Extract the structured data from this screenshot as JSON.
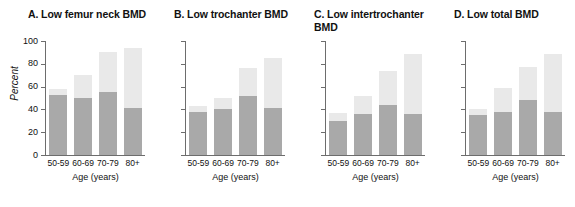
{
  "figure": {
    "axis_title_x": "Age (years)",
    "axis_title_y": "Percent",
    "categories": [
      "50-59",
      "60-69",
      "70-79",
      "80+"
    ],
    "yticks": [
      "0",
      "20",
      "40",
      "60",
      "80",
      "100"
    ],
    "colors": {
      "dark_series": "#a9a9a9",
      "light_series": "#e9e9e9",
      "axis": "#6d6d6d",
      "text": "#111111",
      "background": "#ffffff"
    }
  },
  "panels": [
    {
      "title": "A. Low femur neck BMD",
      "show_y_labels": true
    },
    {
      "title": "B. Low trochanter BMD",
      "show_y_labels": false
    },
    {
      "title": "C. Low intertrochanter\n    BMD",
      "show_y_labels": false
    },
    {
      "title": "D. Low total BMD",
      "show_y_labels": false
    }
  ],
  "chart_data": [
    {
      "type": "bar",
      "title": "A. Low femur neck BMD",
      "xlabel": "Age (years)",
      "ylabel": "Percent",
      "ylim": [
        0,
        100
      ],
      "yticks": [
        0,
        20,
        40,
        60,
        80,
        100
      ],
      "grid": false,
      "stacked": true,
      "categories": [
        "50-59",
        "60-69",
        "70-79",
        "80+"
      ],
      "series": [
        {
          "name": "dark",
          "values": [
            53,
            50,
            55,
            41
          ]
        },
        {
          "name": "light_total",
          "values": [
            58,
            70,
            90,
            94
          ]
        }
      ]
    },
    {
      "type": "bar",
      "title": "B. Low trochanter BMD",
      "xlabel": "Age (years)",
      "ylabel": "",
      "ylim": [
        0,
        100
      ],
      "yticks": [
        0,
        20,
        40,
        60,
        80,
        100
      ],
      "grid": false,
      "stacked": true,
      "categories": [
        "50-59",
        "60-69",
        "70-79",
        "80+"
      ],
      "series": [
        {
          "name": "dark",
          "values": [
            38,
            40,
            52,
            41
          ]
        },
        {
          "name": "light_total",
          "values": [
            43,
            50,
            76,
            85
          ]
        }
      ]
    },
    {
      "type": "bar",
      "title": "C. Low intertrochanter BMD",
      "xlabel": "Age (years)",
      "ylabel": "",
      "ylim": [
        0,
        100
      ],
      "yticks": [
        0,
        20,
        40,
        60,
        80,
        100
      ],
      "grid": false,
      "stacked": true,
      "categories": [
        "50-59",
        "60-69",
        "70-79",
        "80+"
      ],
      "series": [
        {
          "name": "dark",
          "values": [
            30,
            36,
            44,
            36
          ]
        },
        {
          "name": "light_total",
          "values": [
            37,
            52,
            74,
            89
          ]
        }
      ]
    },
    {
      "type": "bar",
      "title": "D. Low total BMD",
      "xlabel": "Age (years)",
      "ylabel": "",
      "ylim": [
        0,
        100
      ],
      "yticks": [
        0,
        20,
        40,
        60,
        80,
        100
      ],
      "grid": false,
      "stacked": true,
      "categories": [
        "50-59",
        "60-69",
        "70-79",
        "80+"
      ],
      "series": [
        {
          "name": "dark",
          "values": [
            35,
            38,
            48,
            38
          ]
        },
        {
          "name": "light_total",
          "values": [
            40,
            59,
            77,
            89
          ]
        }
      ]
    }
  ]
}
